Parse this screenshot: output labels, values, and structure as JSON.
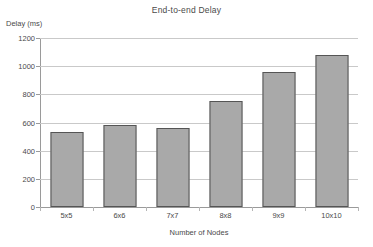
{
  "chart_data": {
    "type": "bar",
    "title": "End-to-end Delay",
    "xlabel": "Number of Nodes",
    "ylabel": "Delay (ms)",
    "categories": [
      "5x5",
      "6x6",
      "7x7",
      "8x8",
      "9x9",
      "10x10"
    ],
    "values": [
      535,
      580,
      563,
      755,
      958,
      1078
    ],
    "ylim": [
      0,
      1200
    ],
    "yticks": [
      0,
      200,
      400,
      600,
      800,
      1000,
      1200
    ],
    "ytick_labels": [
      "0",
      "200",
      "400",
      "600",
      "800",
      "1000",
      "1200"
    ],
    "grid": true,
    "legend": null,
    "series": [
      {
        "name": "End-to-end Delay",
        "values": [
          535,
          580,
          563,
          755,
          958,
          1078
        ]
      }
    ],
    "colors": {
      "bar_fill": "#a9a9a9",
      "bar_border": "#555555",
      "gridline": "#c9c9c9",
      "axis": "#9a9a9a",
      "text": "#4a4a4a",
      "background": "#ffffff"
    }
  }
}
